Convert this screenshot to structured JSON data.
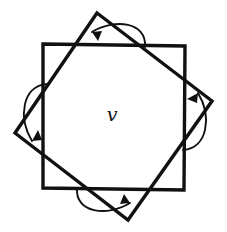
{
  "figure": {
    "background_color": "#ffffff",
    "stroke_color": "#111111",
    "center_label": "v",
    "squares": [
      {
        "name": "upright-square",
        "rotation_degrees": 0,
        "points": "43,44 185,46 184,190 43,188"
      },
      {
        "name": "rotated-square",
        "rotation_degrees": 38,
        "points": "97,13 212,101 128,220 15,133"
      }
    ],
    "arrows": [
      {
        "name": "top-rotation-arrow",
        "position": "top",
        "direction": "counterclockwise",
        "arc_path": "M 145,47 C 147,22 115,18 92,32",
        "head_points": "92,32 102,31 98,41"
      },
      {
        "name": "right-rotation-arrow",
        "position": "right",
        "direction": "counterclockwise",
        "arc_path": "M 183,150 C 208,148 212,116 198,93",
        "head_points": "198,93 197,103 187,99"
      },
      {
        "name": "left-rotation-arrow",
        "position": "left",
        "direction": "counterclockwise",
        "arc_path": "M 47,84 C 22,86 18,118 32,141",
        "head_points": "32,141 42,140 38,130"
      },
      {
        "name": "bottom-rotation-arrow",
        "position": "bottom",
        "direction": "counterclockwise",
        "arc_path": "M 77,188 C 75,213 107,217 130,203",
        "head_points": "130,203 120,204 124,194"
      }
    ],
    "label": {
      "text": "v",
      "x": 112,
      "y": 121
    }
  }
}
